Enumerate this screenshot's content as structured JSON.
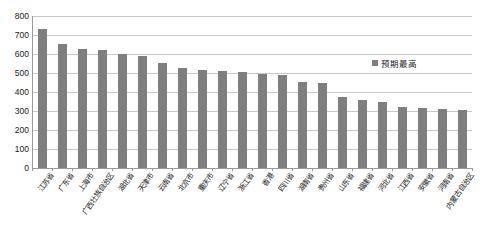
{
  "chart": {
    "title": "",
    "bar_color": "#7f7f7f",
    "gridline_color": "#c8c8c8",
    "axis_color": "#9a9a9a"
  },
  "legend": {
    "position": "top-right",
    "swatch_name": "legend-swatch",
    "entries": [
      {
        "label": "预期最高",
        "color": "#7f7f7f"
      }
    ]
  },
  "yaxis": {
    "min": 0,
    "max": 800,
    "step": 100,
    "ticks": [
      "800",
      "700",
      "600",
      "500",
      "400",
      "300",
      "200",
      "100",
      "0"
    ]
  },
  "chart_data": {
    "type": "bar",
    "title": "",
    "subtitle": "",
    "xlabel": "",
    "ylabel": "",
    "ylim": [
      0,
      800
    ],
    "ytick_step": 100,
    "grid": true,
    "legend_position": "top-right",
    "series_name": "预期最高",
    "categories": [
      "江苏省",
      "广东省",
      "上海市",
      "广西壮族自治区",
      "湖北省",
      "天津市",
      "云南省",
      "北京市",
      "重庆市",
      "辽宁省",
      "浙江省",
      "香港",
      "四川省",
      "湖南省",
      "贵州省",
      "山东省",
      "福建省",
      "河北省",
      "江西省",
      "安徽省",
      "河南省",
      "内蒙古自治区"
    ],
    "values": [
      730,
      655,
      627,
      622,
      602,
      592,
      552,
      525,
      517,
      512,
      507,
      497,
      487,
      455,
      450,
      372,
      358,
      348,
      322,
      315,
      310,
      305
    ],
    "series": [
      {
        "name": "预期最高",
        "color": "#7f7f7f",
        "values": [
          730,
          655,
          627,
          622,
          602,
          592,
          552,
          525,
          517,
          512,
          507,
          497,
          487,
          455,
          450,
          372,
          358,
          348,
          322,
          315,
          310,
          305
        ]
      }
    ]
  }
}
